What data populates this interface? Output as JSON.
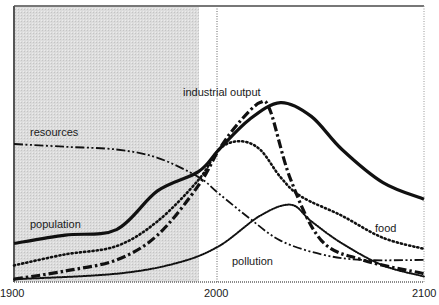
{
  "chart_data": {
    "type": "line",
    "title": "",
    "xlabel": "",
    "ylabel": "",
    "xlim": [
      1900,
      2100
    ],
    "ylim": [
      0,
      100
    ],
    "grid": false,
    "legend": "inline labels",
    "x_ticks": [
      "1900",
      "2000",
      "2100"
    ],
    "shaded_region": {
      "from": 1900,
      "to": 1990,
      "meaning": "historical data period"
    },
    "reference_line": {
      "x": 2000,
      "style": "dotted"
    },
    "series": [
      {
        "name": "population",
        "style": "solid thick",
        "points": [
          [
            1900,
            14
          ],
          [
            1925,
            17
          ],
          [
            1950,
            19
          ],
          [
            1970,
            33
          ],
          [
            1990,
            40
          ],
          [
            2000,
            48
          ],
          [
            2015,
            59
          ],
          [
            2030,
            65
          ],
          [
            2045,
            60
          ],
          [
            2060,
            48
          ],
          [
            2080,
            36
          ],
          [
            2100,
            30
          ]
        ]
      },
      {
        "name": "food",
        "style": "dotted",
        "points": [
          [
            1900,
            6
          ],
          [
            1925,
            10
          ],
          [
            1950,
            13
          ],
          [
            1970,
            22
          ],
          [
            1990,
            37
          ],
          [
            2000,
            48
          ],
          [
            2010,
            51
          ],
          [
            2020,
            48
          ],
          [
            2030,
            38
          ],
          [
            2040,
            31
          ],
          [
            2060,
            24
          ],
          [
            2080,
            16
          ],
          [
            2100,
            12
          ]
        ]
      },
      {
        "name": "industrial output",
        "style": "dash-dot",
        "points": [
          [
            1900,
            1
          ],
          [
            1925,
            4
          ],
          [
            1950,
            8
          ],
          [
            1970,
            17
          ],
          [
            1990,
            35
          ],
          [
            2000,
            48
          ],
          [
            2010,
            58
          ],
          [
            2020,
            65
          ],
          [
            2025,
            62
          ],
          [
            2035,
            37
          ],
          [
            2050,
            15
          ],
          [
            2070,
            8
          ],
          [
            2100,
            3
          ]
        ]
      },
      {
        "name": "resources",
        "style": "dash-dot-dot",
        "points": [
          [
            1900,
            50
          ],
          [
            1925,
            49
          ],
          [
            1950,
            48
          ],
          [
            1970,
            45
          ],
          [
            1990,
            38
          ],
          [
            2000,
            32
          ],
          [
            2015,
            23
          ],
          [
            2030,
            15
          ],
          [
            2050,
            10
          ],
          [
            2070,
            8
          ],
          [
            2100,
            8
          ]
        ]
      },
      {
        "name": "pollution",
        "style": "fine dotted",
        "points": [
          [
            1900,
            1
          ],
          [
            1950,
            3
          ],
          [
            1980,
            7
          ],
          [
            2000,
            13
          ],
          [
            2020,
            24
          ],
          [
            2035,
            28
          ],
          [
            2045,
            22
          ],
          [
            2060,
            14
          ],
          [
            2080,
            6
          ],
          [
            2100,
            2
          ]
        ]
      }
    ]
  },
  "labels": {
    "population": "population",
    "food": "food",
    "industrial_output": "industrial output",
    "resources": "resources",
    "pollution": "pollution"
  },
  "ticks": {
    "x0": "1900",
    "x1": "2000",
    "x2": "2100"
  },
  "colors": {
    "line": "#111111",
    "shade": "#d9d9d9",
    "frame": "#555555"
  }
}
